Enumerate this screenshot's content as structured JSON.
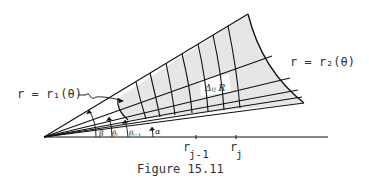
{
  "figure": {
    "caption": "Figure 15.11",
    "inner_curve_label": "r = r₁(θ)",
    "outer_curve_label": "r = r₂(θ)",
    "region_label": "Δᵢⱼ R",
    "axis_labels": {
      "r_jm1": "r",
      "r_jm1_sub": "j-1",
      "r_j": "r",
      "r_j_sub": "j"
    },
    "angle_labels": {
      "beta": "β",
      "theta_i": "θᵢ",
      "theta_im1": "θᵢ₋₁",
      "alpha": "α"
    },
    "colors": {
      "fill": "#e6e6e6",
      "line": "#111111",
      "highlight_cell": "#ffffff"
    }
  }
}
